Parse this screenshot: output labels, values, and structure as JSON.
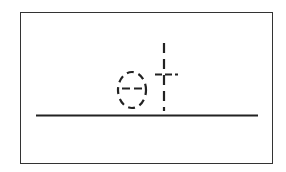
{
  "worksheet": {
    "letters": [
      "e",
      "t"
    ],
    "style": "dashed-tracing",
    "stroke_color": "#222222",
    "border_color": "#333333",
    "baseline_color": "#222222"
  }
}
